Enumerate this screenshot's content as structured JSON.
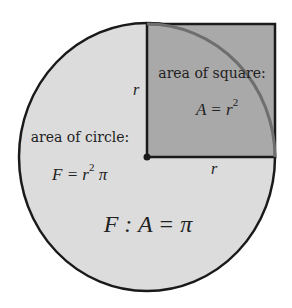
{
  "diagram": {
    "colors": {
      "background": "#ffffff",
      "circle_fill": "#dcdcdc",
      "square_fill": "#a9a9a9",
      "outline": "#1a1a1a",
      "arc": "#6e6e6e",
      "text": "#222222"
    },
    "square": {
      "label": "area of square:",
      "formula_lhs": "A = r",
      "formula_exp": "2"
    },
    "circle": {
      "label": "area of circle:",
      "formula_lhs": "F = r",
      "formula_exp": "2",
      "formula_rhs": " π"
    },
    "radius_label_vertical": "r",
    "radius_label_horizontal": "r",
    "ratio": "F : A = π"
  }
}
